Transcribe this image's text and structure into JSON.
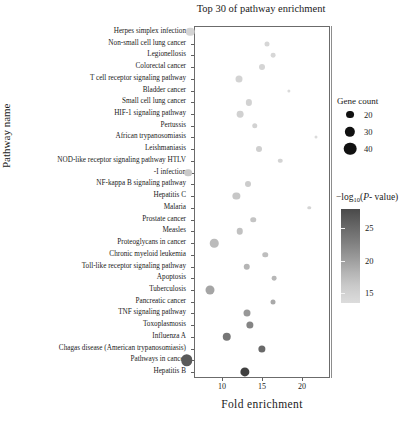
{
  "chart_data": {
    "type": "scatter",
    "title": "Top 30 of pathway enrichment",
    "xlabel": "Fold  enrichment",
    "ylabel": "Pathway name",
    "xlim": [
      5.5,
      22.5
    ],
    "ylim_rows": 30,
    "grid": false,
    "xticks": [
      10,
      15,
      20
    ],
    "xtick_labels": [
      "10",
      "15",
      "20"
    ],
    "size_encoding": "Gene count",
    "color_encoding": "-log10(P-value)",
    "categories": [
      "Herpes simplex infection",
      "Non-small cell lung cancer",
      "Legionellosis",
      "Colorectal cancer",
      "T cell receptor signaling pathway",
      "Bladder cancer",
      "Small cell lung cancer",
      "HIF-1 signaling pathway",
      "Pertussis",
      "African trypanosomiasis",
      "Leishmaniasis",
      "NOD-like receptor signaling pathway HTLV",
      "-I infection",
      "NF-kappa B signaling pathway",
      "Hepatitis C",
      "Malaria",
      "Prostate cancer",
      "Measles",
      "Proteoglycans in cancer",
      "Chronic myeloid leukemia",
      "Toll-like receptor signaling pathway",
      "Apoptosis",
      "Tuberculosis",
      "Pancreatic cancer",
      "TNF signaling pathway",
      "Toxoplasmosis",
      "Influenza A",
      "Chagas disease (American trypanosomiasis)",
      "Pathways in cancer",
      "Hepatitis B"
    ],
    "points": [
      {
        "pathway": "Herpes simplex infection",
        "fold_enrichment": 6.0,
        "gene_count": 30,
        "neglog10p": 14.4
      },
      {
        "pathway": "Non-small cell lung cancer",
        "fold_enrichment": 15.6,
        "gene_count": 16,
        "neglog10p": 14.2
      },
      {
        "pathway": "Legionellosis",
        "fold_enrichment": 16.4,
        "gene_count": 15,
        "neglog10p": 14.1
      },
      {
        "pathway": "Colorectal cancer",
        "fold_enrichment": 15.0,
        "gene_count": 20,
        "neglog10p": 14.3
      },
      {
        "pathway": "T cell receptor signaling pathway",
        "fold_enrichment": 12.1,
        "gene_count": 24,
        "neglog10p": 14.5
      },
      {
        "pathway": "Bladder cancer",
        "fold_enrichment": 18.4,
        "gene_count": 9,
        "neglog10p": 13.9
      },
      {
        "pathway": "Small cell lung cancer",
        "fold_enrichment": 13.4,
        "gene_count": 21,
        "neglog10p": 14.6
      },
      {
        "pathway": "HIF-1 signaling pathway",
        "fold_enrichment": 12.3,
        "gene_count": 23,
        "neglog10p": 14.7
      },
      {
        "pathway": "Pertussis",
        "fold_enrichment": 14.1,
        "gene_count": 18,
        "neglog10p": 14.6
      },
      {
        "pathway": "African trypanosomiasis",
        "fold_enrichment": 21.8,
        "gene_count": 8,
        "neglog10p": 13.8
      },
      {
        "pathway": "Leishmaniasis",
        "fold_enrichment": 14.6,
        "gene_count": 20,
        "neglog10p": 14.8
      },
      {
        "pathway": "NOD-like receptor signaling pathway HTLV",
        "fold_enrichment": 17.3,
        "gene_count": 14,
        "neglog10p": 14.5
      },
      {
        "pathway": "-I infection",
        "fold_enrichment": 5.8,
        "gene_count": 27,
        "neglog10p": 15.4
      },
      {
        "pathway": "NF-kappa B signaling pathway",
        "fold_enrichment": 13.2,
        "gene_count": 20,
        "neglog10p": 15.1
      },
      {
        "pathway": "Hepatitis C",
        "fold_enrichment": 11.8,
        "gene_count": 25,
        "neglog10p": 15.6
      },
      {
        "pathway": "Malaria",
        "fold_enrichment": 20.9,
        "gene_count": 10,
        "neglog10p": 14.4
      },
      {
        "pathway": "Prostate cancer",
        "fold_enrichment": 13.9,
        "gene_count": 18,
        "neglog10p": 15.8
      },
      {
        "pathway": "Measles",
        "fold_enrichment": 12.2,
        "gene_count": 22,
        "neglog10p": 16.1
      },
      {
        "pathway": "Proteoglycans in cancer",
        "fold_enrichment": 9.0,
        "gene_count": 30,
        "neglog10p": 16.6
      },
      {
        "pathway": "Chronic myeloid leukemia",
        "fold_enrichment": 15.4,
        "gene_count": 18,
        "neglog10p": 16.4
      },
      {
        "pathway": "Toll-like receptor signaling pathway",
        "fold_enrichment": 13.1,
        "gene_count": 22,
        "neglog10p": 17.2
      },
      {
        "pathway": "Apoptosis",
        "fold_enrichment": 16.5,
        "gene_count": 15,
        "neglog10p": 17.0
      },
      {
        "pathway": "Tuberculosis",
        "fold_enrichment": 8.5,
        "gene_count": 32,
        "neglog10p": 18.6
      },
      {
        "pathway": "Pancreatic cancer",
        "fold_enrichment": 16.4,
        "gene_count": 16,
        "neglog10p": 18.2
      },
      {
        "pathway": "TNF signaling pathway",
        "fold_enrichment": 13.1,
        "gene_count": 24,
        "neglog10p": 19.8
      },
      {
        "pathway": "Toxoplasmosis",
        "fold_enrichment": 13.5,
        "gene_count": 25,
        "neglog10p": 21.6
      },
      {
        "pathway": "Influenza A",
        "fold_enrichment": 10.6,
        "gene_count": 30,
        "neglog10p": 22.8
      },
      {
        "pathway": "Chagas disease (American trypanosomiasis)",
        "fold_enrichment": 15.0,
        "gene_count": 25,
        "neglog10p": 24.0
      },
      {
        "pathway": "Pathways in cancer",
        "fold_enrichment": 5.6,
        "gene_count": 42,
        "neglog10p": 25.4
      },
      {
        "pathway": "Hepatitis B",
        "fold_enrichment": 12.9,
        "gene_count": 33,
        "neglog10p": 27.6
      }
    ],
    "size_legend": {
      "title": "Gene count",
      "entries": [
        {
          "label": "20",
          "value": 20
        },
        {
          "label": "30",
          "value": 30
        },
        {
          "label": "40",
          "value": 40
        }
      ]
    },
    "color_legend": {
      "title_prefix": "−log",
      "title_sub": "10",
      "title_mid": "(",
      "title_italic": "P",
      "title_suffix": "- value)",
      "ticks": [
        25,
        20,
        15
      ],
      "tick_labels": [
        "25",
        "20",
        "15"
      ],
      "range": [
        13.5,
        28.0
      ],
      "low_color": "#dcdcdc",
      "high_color": "#4a4a4a"
    }
  }
}
